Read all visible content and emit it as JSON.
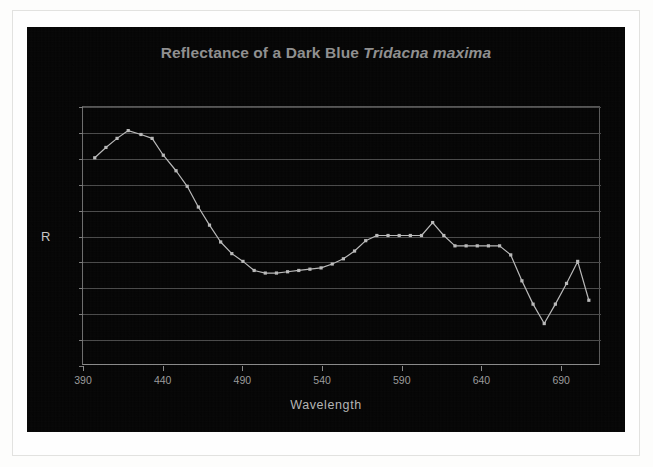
{
  "chart": {
    "title_main": "Reflectance of a Dark Blue ",
    "title_species": "Tridacna maxima",
    "y_axis_title": "R",
    "x_axis_title": "Wavelength",
    "series_color": "#b9b9b9",
    "grid_color": "#4a4a4a",
    "background_color": "#050505",
    "title_color": "#8f8f8f"
  },
  "chart_data": {
    "type": "line",
    "title": "Reflectance of a Dark Blue Tridacna maxima",
    "xlabel": "Wavelength",
    "ylabel": "R",
    "xlim": [
      390,
      715
    ],
    "ylim": [
      0,
      2
    ],
    "grid": true,
    "legend": "none",
    "xticks": [
      390,
      440,
      490,
      540,
      590,
      640,
      690
    ],
    "yticks": [
      0,
      0.2,
      0.4,
      0.6,
      0.8,
      1,
      1.2,
      1.4,
      1.6,
      1.8,
      2
    ],
    "ytick_labels": [
      "0",
      "0.2",
      "0.4",
      "0.6",
      "0.8",
      "1",
      "1.2",
      "1.4",
      "1.6",
      "1.8",
      "2"
    ],
    "xtick_labels": [
      "390",
      "440",
      "490",
      "540",
      "590",
      "640",
      "690"
    ],
    "series": [
      {
        "name": "Reflectance",
        "x": [
          398,
          405,
          412,
          419,
          427,
          434,
          441,
          449,
          456,
          463,
          470,
          477,
          484,
          491,
          498,
          505,
          512,
          519,
          526,
          533,
          540,
          547,
          554,
          561,
          568,
          575,
          582,
          589,
          596,
          603,
          610,
          617,
          624,
          631,
          638,
          645,
          652,
          659,
          666,
          673,
          680,
          687,
          694,
          701,
          708
        ],
        "y": [
          1.6,
          1.68,
          1.75,
          1.81,
          1.78,
          1.75,
          1.62,
          1.5,
          1.38,
          1.22,
          1.08,
          0.95,
          0.86,
          0.8,
          0.73,
          0.71,
          0.71,
          0.72,
          0.73,
          0.74,
          0.75,
          0.78,
          0.82,
          0.88,
          0.96,
          1.0,
          1.0,
          1.0,
          1.0,
          1.0,
          1.1,
          1.0,
          0.92,
          0.92,
          0.92,
          0.92,
          0.92,
          0.85,
          0.65,
          0.47,
          0.32,
          0.47,
          0.63,
          0.8,
          0.5
        ]
      }
    ]
  }
}
